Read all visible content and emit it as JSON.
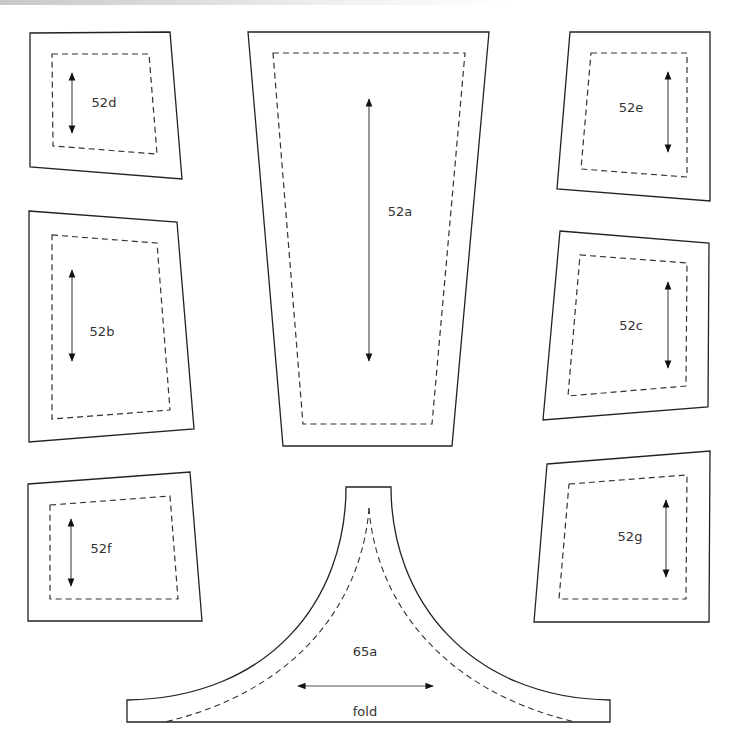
{
  "diagram": {
    "pieces": [
      {
        "id": "52d",
        "label": "52d",
        "outer": "30,33 170,32 182,179 30,167",
        "seam": "52,54 149,54 157,154 53,146",
        "grain": {
          "x": 72,
          "y1": 73,
          "y2": 133
        },
        "label_pos": {
          "x": 104,
          "y": 107
        }
      },
      {
        "id": "52a",
        "label": "52a",
        "outer": "248,32 489,32 452,446 283,446",
        "seam": "273,53 465,53 432,424 303,424",
        "grain": {
          "x": 369,
          "y1": 99,
          "y2": 361
        },
        "label_pos": {
          "x": 400,
          "y": 216
        }
      },
      {
        "id": "52e",
        "label": "52e",
        "outer": "570,32 710,32 710,201 557,189",
        "seam": "591,53 687,53 687,177 581,169",
        "grain": {
          "x": 668,
          "y1": 72,
          "y2": 152
        },
        "label_pos": {
          "x": 631,
          "y": 112
        }
      },
      {
        "id": "52b",
        "label": "52b",
        "outer": "29,211 177,222 194,429 29,442",
        "seam": "52,235 157,243 170,410 52,419",
        "grain": {
          "x": 72,
          "y1": 270,
          "y2": 361
        },
        "label_pos": {
          "x": 102,
          "y": 336
        }
      },
      {
        "id": "52c",
        "label": "52c",
        "outer": "560,231 709,243 708,407 543,420",
        "seam": "580,255 687,263 686,386 568,396",
        "grain": {
          "x": 668,
          "y1": 282,
          "y2": 368
        },
        "label_pos": {
          "x": 631,
          "y": 330
        }
      },
      {
        "id": "52f",
        "label": "52f",
        "outer": "28,484 190,472 202,621 28,621",
        "seam": "50,505 170,496 178,599 50,599",
        "grain": {
          "x": 71,
          "y1": 519,
          "y2": 586
        },
        "label_pos": {
          "x": 101,
          "y": 553
        }
      },
      {
        "id": "52g",
        "label": "52g",
        "outer": "547,464 710,451 709,622 534,622",
        "seam": "569,484 687,475 686,599 559,599",
        "grain": {
          "x": 666,
          "y1": 500,
          "y2": 577
        },
        "label_pos": {
          "x": 630,
          "y": 541
        }
      },
      {
        "id": "65a",
        "label": "65a",
        "sublabel": "fold",
        "label_pos": {
          "x": 365,
          "y": 656
        },
        "sublabel_pos": {
          "x": 365,
          "y": 716
        },
        "grain_h": {
          "y": 686,
          "x1": 298,
          "x2": 433
        }
      }
    ]
  },
  "colors": {
    "outline": "#222222",
    "seam": "#333333",
    "label": "#333333",
    "background": "#ffffff"
  }
}
